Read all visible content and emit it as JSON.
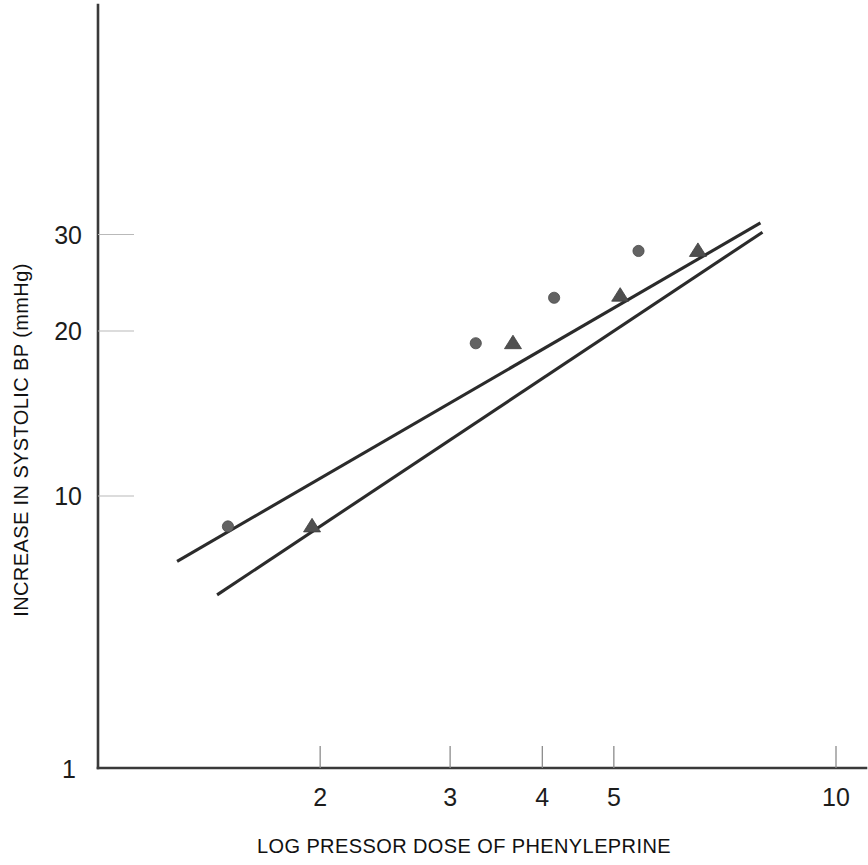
{
  "chart_data": {
    "type": "scatter",
    "title": "",
    "xlabel": "LOG PRESSOR DOSE OF PHENYLEPRINE",
    "ylabel": "INCREASE IN SYSTOLIC BP (mmHg)",
    "xscale": "log",
    "yscale": "log",
    "xlim": [
      1,
      10
    ],
    "ylim": [
      1,
      40
    ],
    "grid": false,
    "legend": "none",
    "x_ticks": [
      {
        "value": 1,
        "label": "1"
      },
      {
        "value": 2,
        "label": "2"
      },
      {
        "value": 3,
        "label": "3"
      },
      {
        "value": 4,
        "label": "4"
      },
      {
        "value": 5,
        "label": "5"
      },
      {
        "value": 10,
        "label": "10"
      }
    ],
    "y_ticks": [
      {
        "value": 1,
        "label": "1"
      },
      {
        "value": 10,
        "label": "10"
      },
      {
        "value": 20,
        "label": "20"
      },
      {
        "value": 30,
        "label": "30"
      }
    ],
    "series": [
      {
        "name": "circle-series",
        "marker": "circle",
        "color": "#636363",
        "points": [
          {
            "x": 1.5,
            "y": 8.8
          },
          {
            "x": 3.25,
            "y": 19.0
          },
          {
            "x": 4.15,
            "y": 23.0
          },
          {
            "x": 5.4,
            "y": 28.0
          }
        ],
        "fit_line": {
          "x0": 1.28,
          "y0": 7.6,
          "x1": 7.9,
          "y1": 31.5
        }
      },
      {
        "name": "triangle-series",
        "marker": "triangle",
        "color": "#4f4f4f",
        "points": [
          {
            "x": 1.95,
            "y": 8.8
          },
          {
            "x": 3.65,
            "y": 19.0
          },
          {
            "x": 5.1,
            "y": 23.2
          },
          {
            "x": 6.5,
            "y": 28.0
          }
        ],
        "fit_line": {
          "x0": 1.45,
          "y0": 6.6,
          "x1": 7.95,
          "y1": 30.3
        }
      }
    ]
  },
  "axis_labels": {
    "x_title": "LOG PRESSOR DOSE OF PHENYLEPRINE",
    "y_title": "INCREASE IN SYSTOLIC BP (mmHg)"
  }
}
